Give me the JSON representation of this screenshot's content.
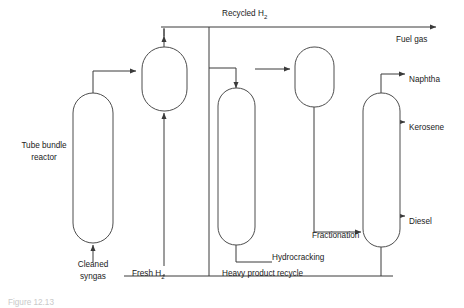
{
  "figure": {
    "type": "process-flow-diagram",
    "caption_partial": "Figure 12.13",
    "background_color": "#ffffff",
    "line_color": "#3a3a3a",
    "vessel_stroke_color": "#4d4d4d",
    "text_color": "#1a1a1a"
  },
  "equipment": [
    {
      "id": "tube-bundle-reactor",
      "label": "Tube bundle",
      "label_line2": "reactor",
      "label_x": 44,
      "label_y": 146,
      "label_y2": 158,
      "label_anchor": "middle",
      "x": 73,
      "y": 93,
      "width": 40,
      "height": 147,
      "radius": 20
    },
    {
      "id": "separator-vessel",
      "label": "",
      "x": 142,
      "y": 47,
      "width": 45,
      "height": 64,
      "radius": 22
    },
    {
      "id": "hydrocracking-vessel",
      "label": "Hydrocracking",
      "label_x": 272,
      "label_y": 258,
      "label_anchor": "start",
      "x": 218,
      "y": 90,
      "width": 37,
      "height": 155,
      "radius": 18
    },
    {
      "id": "upper-separator-vessel",
      "label": "",
      "x": 295,
      "y": 47,
      "width": 39,
      "height": 60,
      "radius": 19
    },
    {
      "id": "fractionation-column",
      "label": "Fractionation",
      "label_x": 312,
      "label_y": 236,
      "label_anchor": "start",
      "x": 363,
      "y": 93,
      "width": 37,
      "height": 154,
      "radius": 18
    }
  ],
  "streams": [
    {
      "id": "cleaned-syngas-feed",
      "label": "Cleaned",
      "label_line2": "syngas",
      "label_x": 93,
      "label_y": 265,
      "label_y2": 277,
      "label_anchor": "middle",
      "arrow": true
    },
    {
      "id": "fresh-h2-feed",
      "label": "Fresh H",
      "subscript": "2",
      "label_x": 132,
      "label_y": 274,
      "label_anchor": "start",
      "arrow": true
    },
    {
      "id": "recycled-h2",
      "label": "Recycled H",
      "subscript": "2",
      "label_x": 222,
      "label_y": 14,
      "label_anchor": "start",
      "arrow": true
    },
    {
      "id": "fuel-gas-product",
      "label": "Fuel gas",
      "label_x": 396,
      "label_y": 40,
      "label_anchor": "start",
      "arrow": true
    },
    {
      "id": "naphtha-product",
      "label": "Naphtha",
      "label_x": 409,
      "label_y": 80,
      "label_anchor": "start",
      "arrow": true
    },
    {
      "id": "kerosene-product",
      "label": "Kerosene",
      "label_x": 409,
      "label_y": 128,
      "label_anchor": "start",
      "arrow": true
    },
    {
      "id": "diesel-product",
      "label": "Diesel",
      "label_x": 409,
      "label_y": 222,
      "label_anchor": "start",
      "arrow": true
    },
    {
      "id": "heavy-product-recycle",
      "label": "Heavy product recycle",
      "label_x": 222,
      "label_y": 274,
      "label_anchor": "start",
      "arrow": false
    }
  ],
  "paths": {
    "cleaned_syngas_to_reactor": "M 93,262 L 93,243",
    "reactor_top_to_separator": "M 93,93 L 93,71 L 138,71",
    "fresh_h2_riser": "M 164,266 L 164,114",
    "recycled_h2_main": "M 164,27 L 437,27",
    "recycled_h2_tap_from_separator": "M 164,47 L 164,27",
    "separator_branch_right": "M 205,27 L 205,68 L 214,68",
    "hydrocracker_bottom_out": "M 236,245 L 236,260 L 272,260",
    "heavy_recycle_bottom": "M 209,266 L 209,27",
    "bottom_rail": "M 124,276 L 393,276",
    "hydrocracker_to_upper_sep": "M 258,69 L 291,69",
    "upper_sep_down_to_frac": "M 314,107 L 314,232 L 359,232",
    "frac_top_to_naphtha": "M 381,93 L 381,74 L 404,74",
    "frac_kerosene_out": "M 400,122 L 404,122",
    "frac_diesel_out": "M 400,216 L 404,216",
    "frac_bottom_to_recycle": "M 381,247 L 381,276"
  },
  "colors": {
    "line": "#3a3a3a",
    "vessel": "#4d4d4d",
    "text": "#1a1a1a",
    "caption": "#c9c9c9"
  }
}
